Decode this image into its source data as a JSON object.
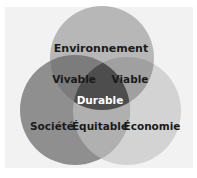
{
  "diagram": {
    "type": "venn",
    "background_color": "#f2f2f2",
    "circles": [
      {
        "id": "environnement",
        "label": "Environnement",
        "cx": 102,
        "cy": 58,
        "r": 52,
        "color": "#b7b7b7"
      },
      {
        "id": "societe",
        "label": "Société",
        "cx": 75,
        "cy": 110,
        "r": 55,
        "color": "#8f8f8f"
      },
      {
        "id": "economie",
        "label": "Économie",
        "cx": 127,
        "cy": 111,
        "r": 54,
        "color": "#d3d3d3"
      }
    ],
    "intersections": [
      {
        "id": "vivable",
        "label": "Vivable",
        "between": [
          "environnement",
          "societe"
        ],
        "color": "#7c7c7c"
      },
      {
        "id": "viable",
        "label": "Viable",
        "between": [
          "environnement",
          "economie"
        ],
        "color": "#a0a0a0"
      },
      {
        "id": "equitable",
        "label": "Équitable",
        "between": [
          "societe",
          "economie"
        ],
        "color": "#b0b0b0"
      },
      {
        "id": "durable",
        "label": "Durable",
        "between": [
          "environnement",
          "societe",
          "economie"
        ],
        "color": "#4d4d4d",
        "text_color": "#ffffff"
      }
    ]
  }
}
